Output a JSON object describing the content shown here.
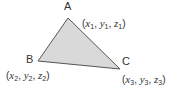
{
  "diagram": {
    "fill": "#d9d9d9",
    "stroke": "#555555",
    "vertices": [
      {
        "name": "A",
        "x": 68,
        "y": 18,
        "coord": {
          "v": [
            "x",
            "y",
            "z"
          ],
          "i": "1"
        }
      },
      {
        "name": "B",
        "x": 38,
        "y": 61,
        "coord": {
          "v": [
            "x",
            "y",
            "z"
          ],
          "i": "2"
        }
      },
      {
        "name": "C",
        "x": 120,
        "y": 69,
        "coord": {
          "v": [
            "x",
            "y",
            "z"
          ],
          "i": "3"
        }
      }
    ]
  },
  "labels": {
    "A": "A",
    "B": "B",
    "C": "C",
    "A_coord": {
      "x": "x",
      "y": "y",
      "z": "z",
      "sub": "1"
    },
    "B_coord": {
      "x": "x",
      "y": "y",
      "z": "z",
      "sub": "2"
    },
    "C_coord": {
      "x": "x",
      "y": "y",
      "z": "z",
      "sub": "3"
    },
    "open": "(",
    "sep": ", ",
    "close": ")"
  }
}
